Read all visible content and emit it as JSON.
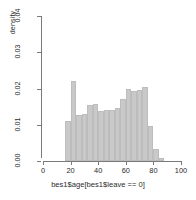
{
  "chart_data": {
    "type": "bar",
    "title": "",
    "subtitle": "",
    "xlabel": "bes1$age[bes1$leave == 0]",
    "ylabel": "density",
    "xlim": [
      0,
      100
    ],
    "ylim": [
      0,
      0.04
    ],
    "grid": false,
    "legend": null,
    "bin_width": 4,
    "bar_color": "#c9c9c9",
    "axis_color": "#7a7a7a",
    "xticks": [
      "0",
      "20",
      "40",
      "60",
      "80",
      "100"
    ],
    "xtick_values": [
      0,
      20,
      40,
      60,
      80,
      100
    ],
    "yticks": [
      "0.00",
      "0.01",
      "0.02",
      "0.03",
      "0.04"
    ],
    "ytick_values": [
      0,
      0.01,
      0.02,
      0.03,
      0.04
    ],
    "bins": [
      {
        "x0": 16,
        "x1": 20,
        "density": 0.011
      },
      {
        "x0": 20,
        "x1": 24,
        "density": 0.0222
      },
      {
        "x0": 24,
        "x1": 28,
        "density": 0.0128
      },
      {
        "x0": 28,
        "x1": 32,
        "density": 0.013
      },
      {
        "x0": 32,
        "x1": 36,
        "density": 0.0155
      },
      {
        "x0": 36,
        "x1": 40,
        "density": 0.0158
      },
      {
        "x0": 40,
        "x1": 44,
        "density": 0.0137
      },
      {
        "x0": 44,
        "x1": 48,
        "density": 0.0142
      },
      {
        "x0": 48,
        "x1": 52,
        "density": 0.0142
      },
      {
        "x0": 52,
        "x1": 56,
        "density": 0.0145
      },
      {
        "x0": 56,
        "x1": 60,
        "density": 0.0172
      },
      {
        "x0": 60,
        "x1": 64,
        "density": 0.02
      },
      {
        "x0": 64,
        "x1": 68,
        "density": 0.0192
      },
      {
        "x0": 68,
        "x1": 72,
        "density": 0.0195
      },
      {
        "x0": 72,
        "x1": 76,
        "density": 0.0203
      },
      {
        "x0": 76,
        "x1": 80,
        "density": 0.0097
      },
      {
        "x0": 80,
        "x1": 84,
        "density": 0.0033
      },
      {
        "x0": 84,
        "x1": 88,
        "density": 0.0007
      }
    ],
    "categories": [
      16,
      20,
      24,
      28,
      32,
      36,
      40,
      44,
      48,
      52,
      56,
      60,
      64,
      68,
      72,
      76,
      80,
      84
    ],
    "values": [
      0.011,
      0.0222,
      0.0128,
      0.013,
      0.0155,
      0.0158,
      0.0137,
      0.0142,
      0.0142,
      0.0145,
      0.0172,
      0.02,
      0.0192,
      0.0195,
      0.0203,
      0.0097,
      0.0033,
      0.0007
    ]
  }
}
